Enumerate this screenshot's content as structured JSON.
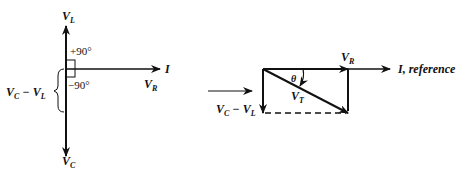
{
  "left_diagram": {
    "v_l": {
      "main": "V",
      "sub": "L"
    },
    "v_c": {
      "main": "V",
      "sub": "C"
    },
    "v_r": {
      "main": "V",
      "sub": "R"
    },
    "current": "I",
    "plus_angle": "+90°",
    "minus_angle": "−90°",
    "difference": {
      "a": "V",
      "a_sub": "C",
      "op": "−",
      "b": "V",
      "b_sub": "L"
    }
  },
  "right_diagram": {
    "v_r": {
      "main": "V",
      "sub": "R"
    },
    "v_t": {
      "main": "V",
      "sub": "T"
    },
    "theta": "θ",
    "reference": "I, reference",
    "difference": {
      "a": "V",
      "a_sub": "C",
      "op": "−",
      "b": "V",
      "b_sub": "L"
    }
  },
  "colors": {
    "ink": "#111111",
    "background": "#ffffff"
  }
}
